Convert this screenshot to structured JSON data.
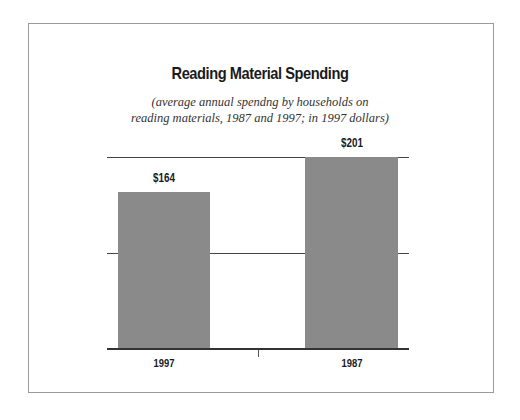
{
  "chart_data": {
    "type": "bar",
    "title": "Reading Material Spending",
    "subtitle": "(average annual spendng by households on reading materials, 1987 and 1997; in 1997 dollars)",
    "subtitle_lines": [
      "(average annual spendng by households on",
      "reading materials, 1987 and 1997; in 1997 dollars)"
    ],
    "categories": [
      "1997",
      "1987"
    ],
    "values": [
      164,
      201
    ],
    "value_labels": [
      "$164",
      "$201"
    ],
    "xlabel": "",
    "ylabel": "",
    "ylim": [
      0,
      201
    ],
    "grid": true,
    "legend": "none",
    "bar_color": "#8a8a8a"
  }
}
